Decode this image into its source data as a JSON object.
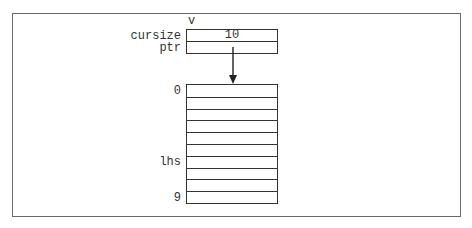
{
  "diagram": {
    "variable_name": "v",
    "struct_fields": [
      {
        "label": "cursize",
        "value": "10"
      },
      {
        "label": "ptr",
        "value": ""
      }
    ],
    "array": {
      "length": 10,
      "index_labels": [
        {
          "row": 0,
          "label": "0"
        },
        {
          "row": 6,
          "label": "lhs"
        },
        {
          "row": 9,
          "label": "9"
        }
      ]
    },
    "arrow": {
      "from": "ptr",
      "to": "array[0]"
    }
  }
}
